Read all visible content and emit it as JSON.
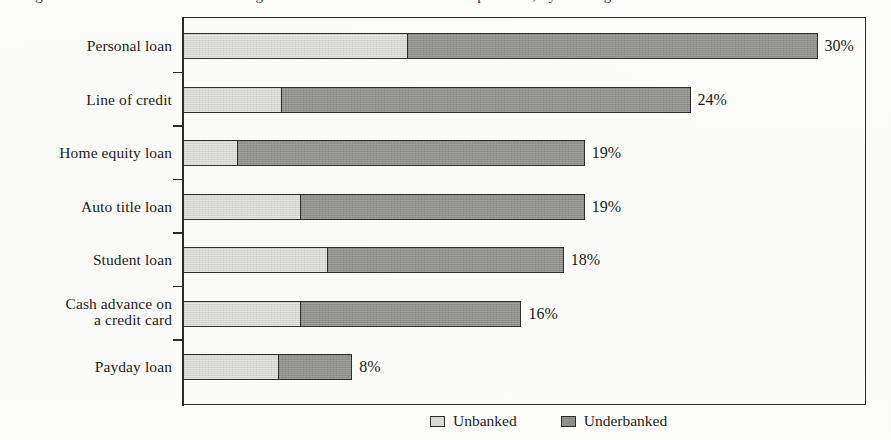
{
  "title_sliver": "Figure 1.  Percent of households using alternative and traditional credit products, by banking status",
  "legend": {
    "position": "bottom-center",
    "items": [
      {
        "label": "Unbanked",
        "color": "#d3d3d1",
        "swatch": "unbanked-swatch"
      },
      {
        "label": "Underbanked",
        "color": "#8e8e8c",
        "swatch": "underbanked-swatch"
      }
    ]
  },
  "chart_data": {
    "type": "bar",
    "orientation": "horizontal",
    "stacked": true,
    "title": "",
    "xlabel": "",
    "ylabel": "",
    "xlim": [
      0,
      32
    ],
    "grid": false,
    "legend_position": "bottom-center",
    "categories": [
      "Personal loan",
      "Line of credit",
      "Home equity loan",
      "Auto title loan",
      "Student loan",
      "Cash advance on\na credit card",
      "Payday loan"
    ],
    "series": [
      {
        "name": "Unbanked",
        "color": "#d3d3d1",
        "values": [
          10.6,
          4.6,
          2.5,
          5.5,
          6.8,
          5.5,
          4.5
        ]
      },
      {
        "name": "Underbanked",
        "color": "#8e8e8c",
        "values": [
          19.4,
          19.4,
          16.5,
          13.5,
          11.2,
          10.5,
          3.5
        ]
      }
    ],
    "totals": [
      30,
      24,
      19,
      19,
      18,
      16,
      8
    ],
    "data_labels": [
      "30%",
      "24%",
      "19%",
      "19%",
      "18%",
      "16%",
      "8%"
    ]
  },
  "rows": [
    {
      "label": "Personal loan",
      "label_line1": "Personal loan",
      "label_line2": "",
      "value_label": "30%",
      "total": 30,
      "unbanked": 10.6,
      "underbanked": 19.4
    },
    {
      "label": "Line of credit",
      "label_line1": "Line of credit",
      "label_line2": "",
      "value_label": "24%",
      "total": 24,
      "unbanked": 4.6,
      "underbanked": 19.4
    },
    {
      "label": "Home equity loan",
      "label_line1": "Home equity loan",
      "label_line2": "",
      "value_label": "19%",
      "total": 19,
      "unbanked": 2.5,
      "underbanked": 16.5
    },
    {
      "label": "Auto title loan",
      "label_line1": "Auto title loan",
      "label_line2": "",
      "value_label": "19%",
      "total": 19,
      "unbanked": 5.5,
      "underbanked": 13.5
    },
    {
      "label": "Student loan",
      "label_line1": "Student loan",
      "label_line2": "",
      "value_label": "18%",
      "total": 18,
      "unbanked": 6.8,
      "underbanked": 11.2
    },
    {
      "label": "Cash advance on a credit card",
      "label_line1": "Cash advance on",
      "label_line2": "a credit card",
      "value_label": "16%",
      "total": 16,
      "unbanked": 5.5,
      "underbanked": 10.5
    },
    {
      "label": "Payday loan",
      "label_line1": "Payday loan",
      "label_line2": "",
      "value_label": "8%",
      "total": 8,
      "unbanked": 4.5,
      "underbanked": 3.5
    }
  ]
}
